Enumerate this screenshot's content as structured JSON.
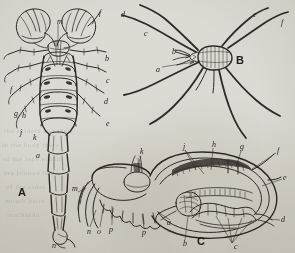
{
  "figure": {
    "background_color": "#dcdad3",
    "ink_color": "#2e2a26",
    "panel_labels": [
      {
        "id": "A",
        "text": "A",
        "x": 18,
        "y": 187,
        "caption": "scorpion, ventral view"
      },
      {
        "id": "B",
        "text": "B",
        "x": 236,
        "y": 55,
        "caption": "harvestman, dorsal view"
      },
      {
        "id": "C",
        "text": "C",
        "x": 197,
        "y": 236,
        "caption": "anatomical section"
      }
    ],
    "panels": {
      "A": {
        "name": "scorpion-ventral",
        "reference_letters": [
          {
            "text": "m",
            "x": 57,
            "y": 18
          },
          {
            "text": "f",
            "x": 99,
            "y": 9
          },
          {
            "text": "b",
            "x": 105,
            "y": 55
          },
          {
            "text": "c",
            "x": 106,
            "y": 77
          },
          {
            "text": "d",
            "x": 104,
            "y": 98
          },
          {
            "text": "e",
            "x": 106,
            "y": 120
          },
          {
            "text": "f",
            "x": 10,
            "y": 86
          },
          {
            "text": "g",
            "x": 14,
            "y": 110
          },
          {
            "text": "h",
            "x": 22,
            "y": 112
          },
          {
            "text": "j",
            "x": 20,
            "y": 129
          },
          {
            "text": "k",
            "x": 33,
            "y": 134
          },
          {
            "text": "a",
            "x": 36,
            "y": 152
          },
          {
            "text": "n",
            "x": 52,
            "y": 242
          }
        ]
      },
      "B": {
        "name": "harvestman-dorsal",
        "reference_letters": [
          {
            "text": "d",
            "x": 121,
            "y": 11
          },
          {
            "text": "c",
            "x": 144,
            "y": 30
          },
          {
            "text": "b",
            "x": 172,
            "y": 48
          },
          {
            "text": "a",
            "x": 156,
            "y": 66
          },
          {
            "text": "e",
            "x": 253,
            "y": 11
          },
          {
            "text": "f",
            "x": 281,
            "y": 19
          }
        ]
      },
      "C": {
        "name": "anatomical-section",
        "reference_letters": [
          {
            "text": "k",
            "x": 140,
            "y": 153
          },
          {
            "text": "j",
            "x": 183,
            "y": 147
          },
          {
            "text": "h",
            "x": 212,
            "y": 144
          },
          {
            "text": "g",
            "x": 240,
            "y": 147
          },
          {
            "text": "f",
            "x": 277,
            "y": 150
          },
          {
            "text": "e",
            "x": 283,
            "y": 177
          },
          {
            "text": "d",
            "x": 281,
            "y": 219
          },
          {
            "text": "c",
            "x": 234,
            "y": 246
          },
          {
            "text": "b",
            "x": 183,
            "y": 243
          },
          {
            "text": "a",
            "x": 167,
            "y": 222
          },
          {
            "text": "m",
            "x": 74,
            "y": 188
          },
          {
            "text": "n",
            "x": 88,
            "y": 230
          },
          {
            "text": "o",
            "x": 98,
            "y": 230
          },
          {
            "text": "p",
            "x": 110,
            "y": 228
          },
          {
            "text": "p",
            "x": 142,
            "y": 231
          }
        ]
      }
    },
    "show_through_text": [
      {
        "text": "the spiders and their",
        "x": 4,
        "y": 127
      },
      {
        "text": "in the body there",
        "x": 2,
        "y": 141
      },
      {
        "text": "of the legs which",
        "x": 3,
        "y": 155
      },
      {
        "text": "are jointed and",
        "x": 4,
        "y": 169
      },
      {
        "text": "of the order",
        "x": 6,
        "y": 183
      },
      {
        "text": "mouth parts",
        "x": 5,
        "y": 197
      },
      {
        "text": "arachnida",
        "x": 7,
        "y": 211
      }
    ]
  }
}
